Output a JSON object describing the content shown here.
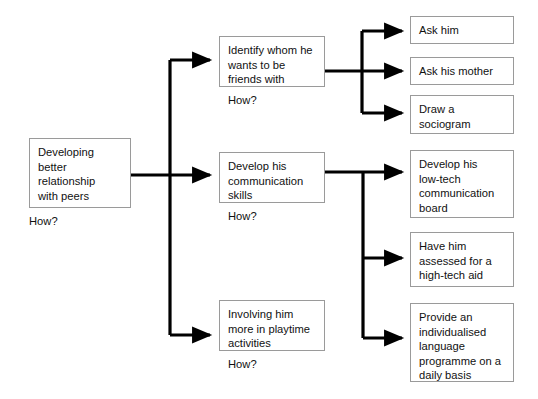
{
  "diagram": {
    "type": "flowchart",
    "background_color": "#ffffff",
    "box_border_color": "#9a9a9a",
    "connector_color": "#000000",
    "text_color": "#111111",
    "how_prompt": "How?",
    "levels": [
      {
        "level": 1,
        "name": "goal",
        "nodes": [
          {
            "id": "goal",
            "text": "Developing\nbetter\nrelationship\nwith peers",
            "has_how_label": true,
            "x": 29,
            "y": 138,
            "w": 102,
            "h": 70
          }
        ]
      },
      {
        "level": 2,
        "name": "strategies",
        "nodes": [
          {
            "id": "strategy-1",
            "text": "Identify whom he\nwants to be\nfriends with",
            "has_how_label": true,
            "x": 219,
            "y": 36,
            "w": 106,
            "h": 51
          },
          {
            "id": "strategy-2",
            "text": "Develop his\ncommunication\nskills",
            "has_how_label": true,
            "x": 219,
            "y": 152,
            "w": 106,
            "h": 51
          },
          {
            "id": "strategy-3",
            "text": "Involving him\nmore in playtime\nactivities",
            "has_how_label": true,
            "x": 219,
            "y": 300,
            "w": 106,
            "h": 51
          }
        ]
      },
      {
        "level": 3,
        "name": "actions",
        "nodes": [
          {
            "id": "action-1",
            "text": "Ask him",
            "has_how_label": false,
            "parent": "strategy-1",
            "x": 410,
            "y": 16,
            "w": 104,
            "h": 28
          },
          {
            "id": "action-2",
            "text": "Ask his mother",
            "has_how_label": false,
            "parent": "strategy-1",
            "x": 410,
            "y": 57,
            "w": 104,
            "h": 28
          },
          {
            "id": "action-3",
            "text": "Draw a\nsociogram",
            "has_how_label": false,
            "parent": "strategy-1",
            "x": 410,
            "y": 95,
            "w": 104,
            "h": 39
          },
          {
            "id": "action-4",
            "text": "Develop his\nlow-tech\ncommunication\nboard",
            "has_how_label": false,
            "parent": "strategy-2",
            "x": 410,
            "y": 150,
            "w": 104,
            "h": 68
          },
          {
            "id": "action-5",
            "text": "Have him\nassessed for a\nhigh-tech aid",
            "has_how_label": false,
            "parent": "strategy-2",
            "x": 410,
            "y": 232,
            "w": 104,
            "h": 55
          },
          {
            "id": "action-6",
            "text": "Provide an\nindividualised\nlanguage\nprogramme on a\ndaily basis",
            "has_how_label": false,
            "parent": "strategy-2",
            "x": 410,
            "y": 303,
            "w": 104,
            "h": 79
          }
        ]
      }
    ],
    "connectors": [
      {
        "id": "trunk-main",
        "from": "goal",
        "to": [
          "strategy-1",
          "strategy-2",
          "strategy-3"
        ],
        "stem_y": 175,
        "stem_x_start": 131,
        "spine_x": 170,
        "spine_y_top": 60,
        "spine_y_bottom": 335,
        "arrow_targets_y": [
          60,
          175,
          335
        ]
      },
      {
        "id": "branch-upper",
        "from": "strategy-1",
        "to": [
          "action-1",
          "action-2",
          "action-3"
        ],
        "stem_y": 71,
        "stem_x_start": 325,
        "spine_x": 362,
        "spine_y_top": 31,
        "spine_y_bottom": 113,
        "arrow_targets_y": [
          31,
          71,
          113
        ]
      },
      {
        "id": "branch-lower",
        "from": "strategy-2",
        "to": [
          "action-4",
          "action-5",
          "action-6"
        ],
        "stem_y": 172,
        "stem_x_start": 325,
        "spine_x": 363,
        "spine_y_top": 172,
        "spine_y_bottom": 338,
        "arrow_targets_y": [
          172,
          258,
          338
        ]
      }
    ]
  }
}
